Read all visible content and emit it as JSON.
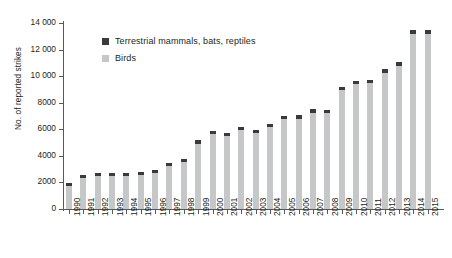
{
  "chart_data": {
    "type": "bar",
    "title": "",
    "subtitle": "",
    "xlabel": "",
    "ylabel": "No. of reported strikes",
    "ylim": [
      0,
      14000
    ],
    "ytick_step": 2000,
    "ytick_labels": [
      "0",
      "2000",
      "4000",
      "6000",
      "8000",
      "10 000",
      "12 000",
      "14 000"
    ],
    "ytick_values": [
      0,
      2000,
      4000,
      6000,
      8000,
      10000,
      12000,
      14000
    ],
    "grid": false,
    "stacked": true,
    "legend_position": "upper-left-inside",
    "categories": [
      "1990",
      "1991",
      "1992",
      "1993",
      "1994",
      "1995",
      "1996",
      "1997",
      "1998",
      "1999",
      "2000",
      "2001",
      "2002",
      "2003",
      "2004",
      "2005",
      "2006",
      "2007",
      "2008",
      "2009",
      "2010",
      "2011",
      "2012",
      "2013",
      "2014",
      "2015"
    ],
    "series": [
      {
        "name": "Birds",
        "color": "#c6c7c9",
        "values": [
          1730,
          2300,
          2460,
          2450,
          2450,
          2580,
          2720,
          3240,
          3560,
          4930,
          5650,
          5480,
          5930,
          5700,
          6170,
          6790,
          6800,
          7260,
          7200,
          8980,
          9380,
          9500,
          10270,
          10790,
          13150,
          13160
        ]
      },
      {
        "name": "Terrestrial mammals, bats, reptiles",
        "color": "#3a3a3c",
        "values": [
          20,
          30,
          40,
          40,
          40,
          60,
          90,
          100,
          100,
          80,
          160,
          140,
          120,
          150,
          180,
          180,
          170,
          190,
          160,
          200,
          180,
          230,
          250,
          280,
          290,
          310
        ]
      }
    ],
    "totals": [
      1750,
      2330,
      2500,
      2490,
      2490,
      2640,
      2810,
      3340,
      3660,
      5010,
      5810,
      5620,
      6050,
      5850,
      6350,
      6970,
      6970,
      7450,
      7360,
      9180,
      9560,
      9730,
      10520,
      11070,
      13440,
      13470
    ]
  },
  "legend": {
    "items": [
      {
        "label": "Terrestrial mammals, bats, reptiles",
        "swatch": "dark"
      },
      {
        "label": "Birds",
        "swatch": "light"
      }
    ]
  },
  "colors": {
    "birds": "#c6c7c9",
    "mammals": "#3a3a3c",
    "axis": "#58595b",
    "text": "#231f20",
    "background": "#ffffff"
  }
}
